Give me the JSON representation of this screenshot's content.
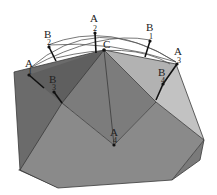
{
  "diagram": {
    "type": "polyhedron-with-geodesic-arcs",
    "colors": {
      "background": "#ffffff",
      "face_dark": "#6e6e6e",
      "face_mid": "#858585",
      "face_front": "#8c8c8c",
      "face_light": "#b4b4b4",
      "face_lighter": "#c4c4c4",
      "face_shadow": "#555555",
      "edge": "#3a3a3a",
      "arc": "#555555",
      "point": "#111111"
    },
    "apex": {
      "label": "C"
    },
    "points": [
      {
        "label": "A",
        "sub": "1"
      },
      {
        "label": "B",
        "sub": "2"
      },
      {
        "label": "A",
        "sub": "2"
      },
      {
        "label": "B",
        "sub": "1"
      },
      {
        "label": "A",
        "sub": "3"
      },
      {
        "label": "B",
        "sub": "3"
      },
      {
        "label": "B",
        "sub": "4"
      },
      {
        "label": "A",
        "sub": "4"
      }
    ]
  }
}
